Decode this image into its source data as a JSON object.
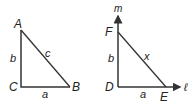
{
  "left_triangle": {
    "vertices": {
      "A": "A",
      "B": "B",
      "C": "C"
    },
    "sides": {
      "AC": "b",
      "CB": "a",
      "AB": "c"
    }
  },
  "right_triangle": {
    "vertices": {
      "F": "F",
      "D": "D",
      "E": "E"
    },
    "sides": {
      "FD": "b",
      "DE": "a",
      "FE": "x"
    },
    "axes": {
      "vertical": "m",
      "horizontal": "ℓ"
    }
  },
  "colors": {
    "stroke": "#333333",
    "text": "#222222"
  }
}
